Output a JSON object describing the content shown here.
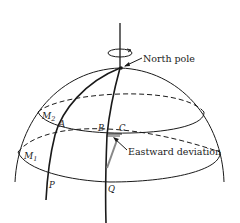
{
  "diagram": {
    "type": "hemisphere-coriolis",
    "labels": {
      "north_pole": "North pole",
      "eastward_deviation": "Eastward deviation",
      "m2": "M",
      "m2_sub": "2",
      "m1": "M",
      "m1_sub": "1",
      "a": "A",
      "b": "B",
      "c": "C",
      "p": "P",
      "q": "Q"
    },
    "colors": {
      "stroke": "#1a1a1a",
      "deviation_path": "#888888",
      "background": "#ffffff"
    }
  }
}
